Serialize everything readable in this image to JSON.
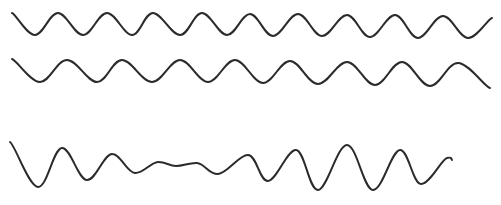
{
  "figure": {
    "background": "#ffffff",
    "stroke_color": "#2b2b2b",
    "waves": [
      {
        "name": "regular-wave-1",
        "points": [
          [
            12,
            13
          ],
          [
            35,
            35
          ],
          [
            58,
            13
          ],
          [
            83,
            35
          ],
          [
            107,
            13
          ],
          [
            132,
            35
          ],
          [
            153,
            13
          ],
          [
            180,
            35
          ],
          [
            202,
            13
          ],
          [
            227,
            35
          ],
          [
            250,
            14
          ],
          [
            273,
            36
          ],
          [
            298,
            14
          ],
          [
            322,
            36
          ],
          [
            347,
            15
          ],
          [
            370,
            37
          ],
          [
            395,
            15
          ],
          [
            418,
            38
          ],
          [
            443,
            16
          ],
          [
            468,
            38
          ],
          [
            492,
            18
          ]
        ]
      },
      {
        "name": "regular-wave-2",
        "points": [
          [
            12,
            59
          ],
          [
            40,
            82
          ],
          [
            67,
            60
          ],
          [
            97,
            82
          ],
          [
            122,
            60
          ],
          [
            152,
            82
          ],
          [
            180,
            60
          ],
          [
            208,
            82
          ],
          [
            235,
            60
          ],
          [
            263,
            83
          ],
          [
            290,
            61
          ],
          [
            318,
            84
          ],
          [
            347,
            62
          ],
          [
            375,
            85
          ],
          [
            402,
            62
          ],
          [
            430,
            86
          ],
          [
            458,
            63
          ],
          [
            490,
            88
          ]
        ]
      },
      {
        "name": "irregular-wave-3",
        "points": [
          [
            10,
            142
          ],
          [
            38,
            187
          ],
          [
            62,
            148
          ],
          [
            87,
            180
          ],
          [
            112,
            154
          ],
          [
            135,
            173
          ],
          [
            158,
            162
          ],
          [
            176,
            166
          ],
          [
            197,
            163
          ],
          [
            218,
            174
          ],
          [
            248,
            155
          ],
          [
            268,
            181
          ],
          [
            296,
            150
          ],
          [
            318,
            190
          ],
          [
            347,
            145
          ],
          [
            373,
            190
          ],
          [
            400,
            150
          ],
          [
            421,
            184
          ],
          [
            447,
            158
          ],
          [
            452,
            160
          ]
        ]
      }
    ]
  }
}
